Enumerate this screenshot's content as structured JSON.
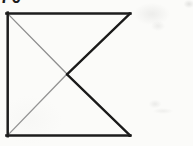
{
  "image": {
    "kind": "scanned-line-drawing",
    "width": 193,
    "height": 146,
    "background_color": "#fbfbf9",
    "description": "Scanned black-ink geometric figure: a three-sided open rectangle with two diagonals meeting at the centre, forming a bowtie / hourglass pattern"
  },
  "figure": {
    "name": "bowtie-rectangle-figure",
    "frame": {
      "left": 7,
      "top": 13,
      "right": 130,
      "bottom": 136,
      "right_edge_drawn": "no"
    },
    "strokes": {
      "dark_color": "#1a1a1a",
      "gray_color": "#8f8f8f",
      "dark_width": "2.2",
      "gray_width": "1.3",
      "frame_width": "2.4"
    },
    "center_point": {
      "x": 67,
      "y": 74
    },
    "edges": [
      {
        "id": "top-edge",
        "label": "Top horizontal edge",
        "from": "7,13",
        "to": "130,13",
        "tone": "dark"
      },
      {
        "id": "left-edge",
        "label": "Left vertical edge",
        "from": "7,13",
        "to": "7,136",
        "tone": "dark"
      },
      {
        "id": "bottom-edge",
        "label": "Bottom horizontal edge",
        "from": "7,136",
        "to": "130,136",
        "tone": "dark"
      }
    ],
    "diagonals": [
      {
        "id": "diagonal-top-right-to-center",
        "label": "Upper right diagonal",
        "from": "130,13",
        "to": "67,74",
        "tone": "dark"
      },
      {
        "id": "diagonal-center-to-bottom-right",
        "label": "Lower right diagonal",
        "from": "67,74",
        "to": "130,136",
        "tone": "dark"
      },
      {
        "id": "diagonal-top-left-to-center",
        "label": "Upper left diagonal",
        "from": "7,13",
        "to": "67,74",
        "tone": "gray"
      },
      {
        "id": "diagonal-center-to-bottom-left",
        "label": "Lower left diagonal",
        "from": "67,74",
        "to": "7,136",
        "tone": "gray"
      }
    ]
  },
  "crop_fragment": {
    "name": "cropped-header-glyphs",
    "text": "70",
    "note": "Bottom sliver of two dark characters clipped by the top edge of the scan"
  }
}
